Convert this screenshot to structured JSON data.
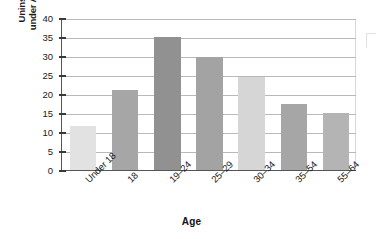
{
  "chart_data": {
    "type": "bar",
    "title": "",
    "xlabel": "Age",
    "ylabel": "Uninsured Americans under Age 65 (in percent)",
    "ylabel_line1": "Uninsured Americans",
    "ylabel_line2": "under Age 65 (in percent)",
    "categories": [
      "Under 18",
      "18",
      "19–24",
      "25–29",
      "30–34",
      "35–54",
      "55–64"
    ],
    "values": [
      11.7,
      21.0,
      35.0,
      29.7,
      24.5,
      17.5,
      15.0
    ],
    "bar_colors": [
      "#e2e2e2",
      "#a6a6a6",
      "#919191",
      "#a3a3a3",
      "#d6d6d6",
      "#a6a6a6",
      "#b4b4b4"
    ],
    "ylim": [
      0,
      40
    ],
    "yticks": [
      0,
      5,
      10,
      15,
      20,
      25,
      30,
      35,
      40
    ],
    "ytick_labels": [
      "0",
      "5",
      "10",
      "15",
      "20",
      "25",
      "30",
      "35",
      "40"
    ],
    "grid": true,
    "grid_axis": "y",
    "legend": null,
    "legend_position": "none",
    "gridline_color": "#b9b9b9",
    "axis_color": "#555555"
  }
}
